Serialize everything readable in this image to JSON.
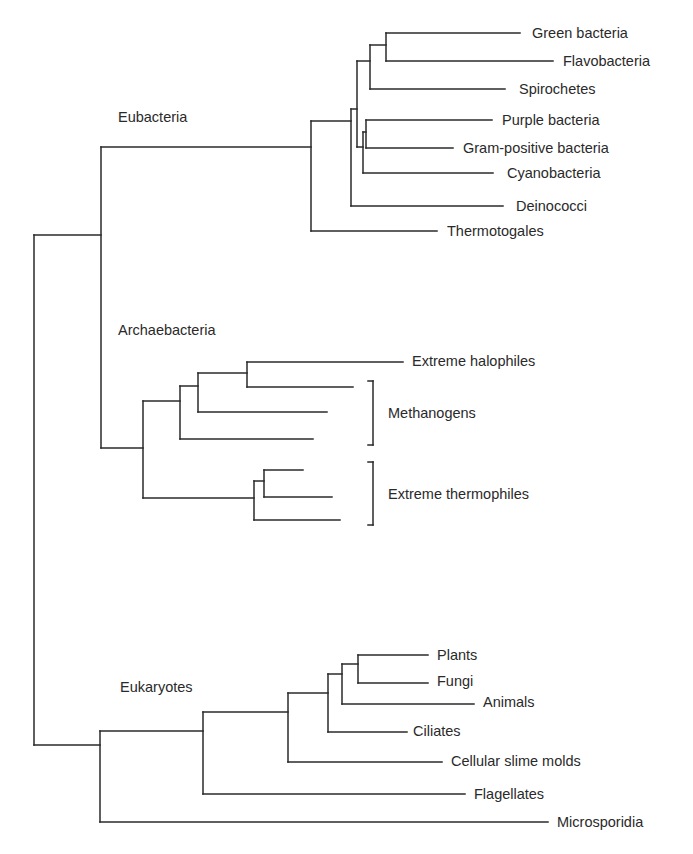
{
  "diagram": {
    "type": "phylogenetic-tree",
    "groups": [
      {
        "key": "eubacteria",
        "label": "Eubacteria",
        "x": 118,
        "y": 117
      },
      {
        "key": "archaebacteria",
        "label": "Archaebacteria",
        "x": 118,
        "y": 330
      },
      {
        "key": "eukaryotes",
        "label": "Eukaryotes",
        "x": 120,
        "y": 687
      }
    ],
    "taxa": [
      {
        "key": "green-bacteria",
        "label": "Green bacteria",
        "x": 532,
        "y": 33
      },
      {
        "key": "flavobacteria",
        "label": "Flavobacteria",
        "x": 563,
        "y": 61
      },
      {
        "key": "spirochetes",
        "label": "Spirochetes",
        "x": 519,
        "y": 89
      },
      {
        "key": "purple-bacteria",
        "label": "Purple bacteria",
        "x": 502,
        "y": 120
      },
      {
        "key": "gram-positive-bacteria",
        "label": "Gram-positive bacteria",
        "x": 463,
        "y": 148
      },
      {
        "key": "cyanobacteria",
        "label": "Cyanobacteria",
        "x": 507,
        "y": 173
      },
      {
        "key": "deinococci",
        "label": "Deinococci",
        "x": 516,
        "y": 206
      },
      {
        "key": "thermotogales",
        "label": "Thermotogales",
        "x": 447,
        "y": 231
      },
      {
        "key": "extreme-halophiles",
        "label": "Extreme halophiles",
        "x": 412,
        "y": 361
      },
      {
        "key": "methanogens",
        "label": "Methanogens",
        "x": 388,
        "y": 413
      },
      {
        "key": "extreme-thermophiles",
        "label": "Extreme thermophiles",
        "x": 388,
        "y": 494
      },
      {
        "key": "plants",
        "label": "Plants",
        "x": 437,
        "y": 655
      },
      {
        "key": "fungi",
        "label": "Fungi",
        "x": 437,
        "y": 681
      },
      {
        "key": "animals",
        "label": "Animals",
        "x": 483,
        "y": 702
      },
      {
        "key": "ciliates",
        "label": "Ciliates",
        "x": 413,
        "y": 731
      },
      {
        "key": "cellular-slime-molds",
        "label": "Cellular slime molds",
        "x": 451,
        "y": 761
      },
      {
        "key": "flagellates",
        "label": "Flagellates",
        "x": 474,
        "y": 794
      },
      {
        "key": "microsporidia",
        "label": "Microsporidia",
        "x": 557,
        "y": 822
      }
    ],
    "brackets": [
      {
        "key": "methanogens-bracket",
        "x": 373,
        "y1": 381,
        "y2": 445
      },
      {
        "key": "extreme-thermophiles-bracket",
        "x": 373,
        "y1": 462,
        "y2": 525
      }
    ],
    "branches": [
      [
        34,
        235,
        34,
        745
      ],
      [
        34,
        235,
        101,
        235
      ],
      [
        101,
        147,
        101,
        448
      ],
      [
        101,
        147,
        311,
        147
      ],
      [
        311,
        121,
        311,
        231
      ],
      [
        311,
        231,
        437,
        231
      ],
      [
        311,
        121,
        351,
        121
      ],
      [
        351,
        109,
        351,
        206
      ],
      [
        351,
        206,
        503,
        206
      ],
      [
        351,
        109,
        357,
        109
      ],
      [
        357,
        61,
        357,
        147
      ],
      [
        357,
        61,
        370,
        61
      ],
      [
        370,
        45,
        370,
        89
      ],
      [
        370,
        89,
        505,
        89
      ],
      [
        370,
        45,
        386,
        45
      ],
      [
        386,
        33,
        386,
        61
      ],
      [
        386,
        33,
        520,
        33
      ],
      [
        386,
        61,
        553,
        61
      ],
      [
        357,
        147,
        363,
        147
      ],
      [
        363,
        132,
        363,
        173
      ],
      [
        363,
        173,
        493,
        173
      ],
      [
        363,
        132,
        366,
        132
      ],
      [
        366,
        120,
        366,
        148
      ],
      [
        366,
        120,
        492,
        120
      ],
      [
        366,
        148,
        453,
        148
      ],
      [
        101,
        448,
        143,
        448
      ],
      [
        143,
        401,
        143,
        498
      ],
      [
        143,
        401,
        180,
        401
      ],
      [
        180,
        386,
        180,
        439
      ],
      [
        180,
        439,
        313,
        439
      ],
      [
        180,
        386,
        198,
        386
      ],
      [
        198,
        373,
        198,
        412
      ],
      [
        198,
        412,
        327,
        412
      ],
      [
        198,
        373,
        247,
        373
      ],
      [
        247,
        362,
        247,
        387
      ],
      [
        247,
        362,
        403,
        362
      ],
      [
        247,
        387,
        353,
        387
      ],
      [
        143,
        498,
        254,
        498
      ],
      [
        254,
        481,
        254,
        520
      ],
      [
        254,
        520,
        340,
        520
      ],
      [
        254,
        481,
        264,
        481
      ],
      [
        264,
        470,
        264,
        497
      ],
      [
        264,
        470,
        303,
        470
      ],
      [
        264,
        497,
        332,
        497
      ],
      [
        34,
        745,
        100,
        745
      ],
      [
        100,
        731,
        100,
        822
      ],
      [
        100,
        822,
        548,
        822
      ],
      [
        100,
        731,
        203,
        731
      ],
      [
        203,
        712,
        203,
        794
      ],
      [
        203,
        794,
        465,
        794
      ],
      [
        203,
        712,
        288,
        712
      ],
      [
        288,
        693,
        288,
        762
      ],
      [
        288,
        762,
        442,
        762
      ],
      [
        288,
        693,
        328,
        693
      ],
      [
        328,
        674,
        328,
        732
      ],
      [
        328,
        732,
        407,
        732
      ],
      [
        328,
        674,
        342,
        674
      ],
      [
        342,
        664,
        342,
        704
      ],
      [
        342,
        704,
        474,
        704
      ],
      [
        342,
        664,
        358,
        664
      ],
      [
        358,
        655,
        358,
        683
      ],
      [
        358,
        655,
        428,
        655
      ],
      [
        358,
        683,
        428,
        683
      ]
    ]
  }
}
